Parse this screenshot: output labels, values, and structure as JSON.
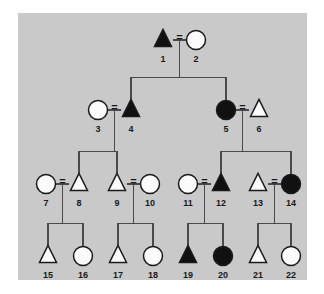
{
  "figure": {
    "panel_color": "#c9c9c9",
    "page_color": "#ffffff",
    "line_color": "#4a4a4a",
    "symbol_outline_color": "#1a1a1a",
    "symbol_open_fill": "#fbfbfb",
    "symbol_filled_fill": "#111111",
    "mating_symbol": "="
  },
  "chart_data": {
    "type": "diagram",
    "subtype": "pedigree",
    "legend": {
      "triangle": "triangle symbol",
      "circle": "circle symbol",
      "filled": "affected (shaded)",
      "open": "unaffected (unshaded)",
      "equals": "mating / marriage line"
    },
    "generations": [
      {
        "name": "I",
        "y": 40,
        "members": [
          1,
          2
        ]
      },
      {
        "name": "II",
        "y": 110,
        "members": [
          3,
          4,
          5,
          6
        ]
      },
      {
        "name": "III",
        "y": 184,
        "members": [
          7,
          8,
          9,
          10,
          11,
          12,
          13,
          14
        ]
      },
      {
        "name": "IV",
        "y": 256,
        "members": [
          15,
          16,
          17,
          18,
          19,
          20,
          21,
          22
        ]
      }
    ],
    "individuals": [
      {
        "id": 1,
        "label": "1",
        "shape": "triangle",
        "fill": "filled",
        "generation": "I",
        "x": 163,
        "y": 40
      },
      {
        "id": 2,
        "label": "2",
        "shape": "circle",
        "fill": "open",
        "generation": "I",
        "x": 196,
        "y": 40
      },
      {
        "id": 3,
        "label": "3",
        "shape": "circle",
        "fill": "open",
        "generation": "II",
        "x": 98,
        "y": 110
      },
      {
        "id": 4,
        "label": "4",
        "shape": "triangle",
        "fill": "filled",
        "generation": "II",
        "x": 131,
        "y": 110
      },
      {
        "id": 5,
        "label": "5",
        "shape": "circle",
        "fill": "filled",
        "generation": "II",
        "x": 226,
        "y": 110
      },
      {
        "id": 6,
        "label": "6",
        "shape": "triangle",
        "fill": "open",
        "generation": "II",
        "x": 259,
        "y": 110
      },
      {
        "id": 7,
        "label": "7",
        "shape": "circle",
        "fill": "open",
        "generation": "III",
        "x": 46,
        "y": 184
      },
      {
        "id": 8,
        "label": "8",
        "shape": "triangle",
        "fill": "open",
        "generation": "III",
        "x": 79,
        "y": 184
      },
      {
        "id": 9,
        "label": "9",
        "shape": "triangle",
        "fill": "open",
        "generation": "III",
        "x": 117,
        "y": 184
      },
      {
        "id": 10,
        "label": "10",
        "shape": "circle",
        "fill": "open",
        "generation": "III",
        "x": 150,
        "y": 184
      },
      {
        "id": 11,
        "label": "11",
        "shape": "circle",
        "fill": "open",
        "generation": "III",
        "x": 188,
        "y": 184
      },
      {
        "id": 12,
        "label": "12",
        "shape": "triangle",
        "fill": "filled",
        "generation": "III",
        "x": 221,
        "y": 184
      },
      {
        "id": 13,
        "label": "13",
        "shape": "triangle",
        "fill": "open",
        "generation": "III",
        "x": 258,
        "y": 184
      },
      {
        "id": 14,
        "label": "14",
        "shape": "circle",
        "fill": "filled",
        "generation": "III",
        "x": 291,
        "y": 184
      },
      {
        "id": 15,
        "label": "15",
        "shape": "triangle",
        "fill": "open",
        "generation": "IV",
        "x": 48,
        "y": 256
      },
      {
        "id": 16,
        "label": "16",
        "shape": "circle",
        "fill": "open",
        "generation": "IV",
        "x": 83,
        "y": 256
      },
      {
        "id": 17,
        "label": "17",
        "shape": "triangle",
        "fill": "open",
        "generation": "IV",
        "x": 118,
        "y": 256
      },
      {
        "id": 18,
        "label": "18",
        "shape": "circle",
        "fill": "open",
        "generation": "IV",
        "x": 153,
        "y": 256
      },
      {
        "id": 19,
        "label": "19",
        "shape": "triangle",
        "fill": "filled",
        "generation": "IV",
        "x": 188,
        "y": 256
      },
      {
        "id": 20,
        "label": "20",
        "shape": "circle",
        "fill": "filled",
        "generation": "IV",
        "x": 223,
        "y": 256
      },
      {
        "id": 21,
        "label": "21",
        "shape": "triangle",
        "fill": "open",
        "generation": "IV",
        "x": 258,
        "y": 256
      },
      {
        "id": 22,
        "label": "22",
        "shape": "circle",
        "fill": "open",
        "generation": "IV",
        "x": 291,
        "y": 256
      }
    ],
    "matings": [
      {
        "id": "m1",
        "partners": [
          1,
          2
        ],
        "eq_x": 179.5,
        "eq_y": 38,
        "children": [
          4,
          5
        ]
      },
      {
        "id": "m2",
        "partners": [
          3,
          4
        ],
        "eq_x": 114.5,
        "eq_y": 108,
        "children": [
          8,
          9
        ]
      },
      {
        "id": "m3",
        "partners": [
          5,
          6
        ],
        "eq_x": 242.5,
        "eq_y": 108,
        "children": [
          12,
          14
        ]
      },
      {
        "id": "m4",
        "partners": [
          7,
          8
        ],
        "eq_x": 62.5,
        "eq_y": 182,
        "children": [
          15,
          16
        ]
      },
      {
        "id": "m5",
        "partners": [
          9,
          10
        ],
        "eq_x": 133.5,
        "eq_y": 182,
        "children": [
          17,
          18
        ]
      },
      {
        "id": "m6",
        "partners": [
          11,
          12
        ],
        "eq_x": 204.5,
        "eq_y": 182,
        "children": [
          19,
          20
        ]
      },
      {
        "id": "m7",
        "partners": [
          13,
          14
        ],
        "eq_x": 274.5,
        "eq_y": 182,
        "children": [
          21,
          22
        ]
      }
    ],
    "counts": {
      "individuals": 22,
      "matings": 7,
      "generations": 4,
      "affected": 7,
      "unaffected": 15
    }
  }
}
